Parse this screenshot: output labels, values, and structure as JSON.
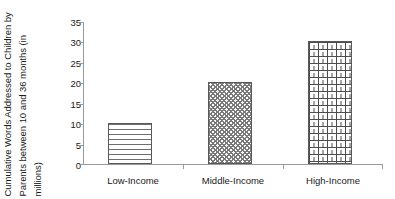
{
  "chart_data": {
    "type": "bar",
    "title": "",
    "xlabel": "",
    "ylabel": "Cumulative Words Addressed to Children by Parents between 10 and 36 months (in millions)",
    "ylabel_lines": [
      "Cumulative Words Addressed to Children by",
      "Parents between 10 and 36 months (in",
      "millions)"
    ],
    "categories": [
      "Low-Income",
      "Middle-Income",
      "High-Income"
    ],
    "values": [
      10,
      20,
      30
    ],
    "ylim": [
      0,
      35
    ],
    "ytick_step": 5,
    "yticks": [
      35,
      30,
      25,
      20,
      15,
      10,
      5,
      0
    ],
    "ytick_labels": [
      "35",
      "30",
      "25",
      "20",
      "15",
      "10",
      "5",
      "0"
    ],
    "grid": false,
    "legend": null,
    "legend_position": "none",
    "bar_patterns": [
      "horizontal-lines",
      "zigzag-wave",
      "brick"
    ],
    "colors": {
      "background": "#ffffff",
      "axis": "#9a9a9a",
      "bar_outline": "#595959",
      "pattern_dark": "#4d4d4d",
      "text": "#1a1a1a"
    }
  }
}
